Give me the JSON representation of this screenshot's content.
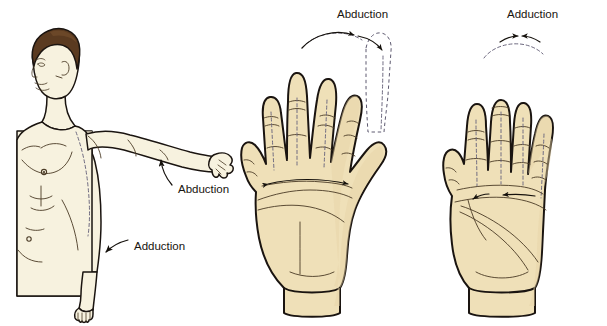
{
  "figure": {
    "background_color": "#ffffff"
  },
  "palette": {
    "body_skin_fill": "#F7F2DF",
    "body_shadow_fill": "#EFE7CC",
    "hand_fill": "#EFE0B8",
    "hand_shade_fill": "#E6D3A6",
    "outline": "#1A1410",
    "crease_line": "#4A3A25",
    "hair": "#5A3A20",
    "hair_highlight": "#7A5230",
    "ghost_dash": "#6E6A80",
    "arrow": "#15110C"
  },
  "panels": [
    {
      "id": "panel-body",
      "name": "upper-limb-figure",
      "subject": "male torso with right arm abducted to horizontal",
      "labels": [
        {
          "id": "body-abduction",
          "text": "Abduction",
          "x": 175,
          "y": 190,
          "pointer": "arrow curving up toward raised arm"
        },
        {
          "id": "body-adduction",
          "text": "Adduction",
          "x": 132,
          "y": 246,
          "pointer": "arrow curving down toward hanging arm"
        }
      ]
    },
    {
      "id": "panel-hand-abduction",
      "name": "hand-fingers-abducted",
      "subject": "left palm with fingers spread apart",
      "labels": [
        {
          "id": "hand-abduction",
          "text": "Abduction",
          "x": 378,
          "y": 14,
          "pointer": "dashed arc with arrowheads spreading outward"
        }
      ],
      "arrows": "outward double-headed arrows across the palm",
      "ghost_digit": "dashed outline showing finger displaced away from midline"
    },
    {
      "id": "panel-hand-adduction",
      "name": "hand-fingers-adducted",
      "subject": "left palm with fingers drawn together",
      "labels": [
        {
          "id": "hand-adduction",
          "text": "Adduction",
          "x": 546,
          "y": 14,
          "pointer": "dashed arc with arrowheads converging inward"
        }
      ],
      "arrows": "inward arrows across the palm",
      "ghost_digit": "dashed midline axes through each digit"
    }
  ],
  "terms": {
    "abduction": "Abduction",
    "adduction": "Adduction"
  }
}
